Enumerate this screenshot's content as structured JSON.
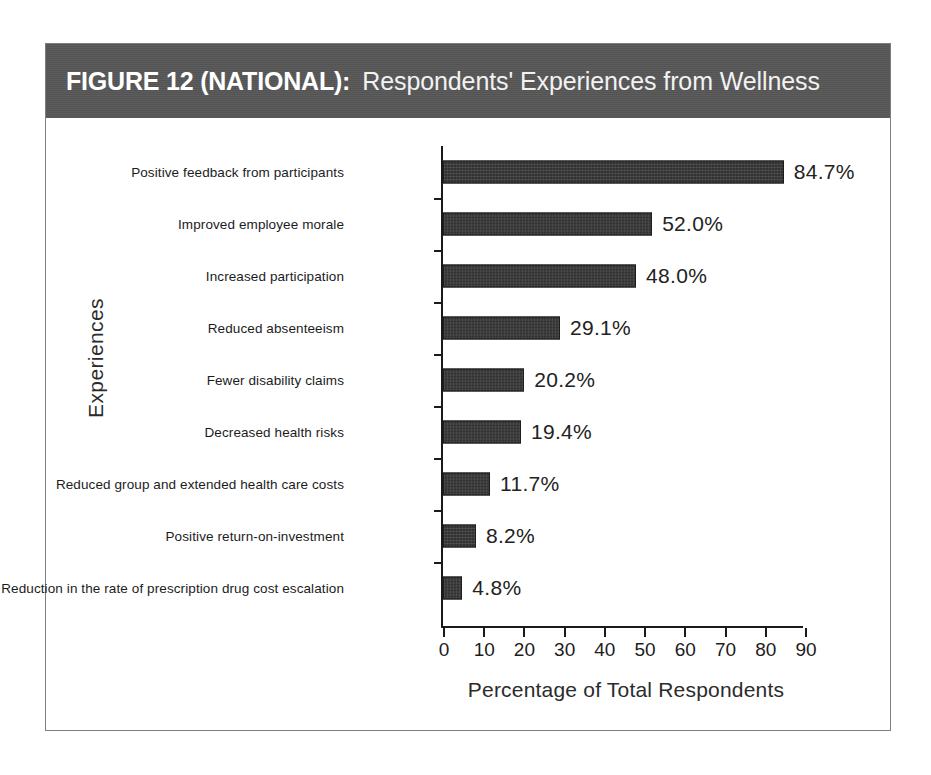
{
  "figure": {
    "label": "FIGURE 12 (NATIONAL):",
    "title": "Respondents' Experiences from Wellness",
    "band_color": "#565656",
    "frame_color": "#7e7e7e",
    "bar_color": "#323232",
    "background": "#ffffff"
  },
  "chart_data": {
    "type": "bar",
    "orientation": "horizontal",
    "title": "Respondents' Experiences from Wellness",
    "xlabel": "Percentage of Total Respondents",
    "ylabel": "Experiences",
    "xlim": [
      0,
      90
    ],
    "xticks": [
      0,
      10,
      20,
      30,
      40,
      50,
      60,
      70,
      80,
      90
    ],
    "grid": false,
    "legend": false,
    "categories": [
      "Positive feedback from participants",
      "Improved employee morale",
      "Increased participation",
      "Reduced absenteeism",
      "Fewer disability claims",
      "Decreased health risks",
      "Reduced group and extended health care costs",
      "Positive return-on-investment",
      "Reduction in the rate of prescription drug cost escalation"
    ],
    "values": [
      84.7,
      52.0,
      48.0,
      29.1,
      20.2,
      19.4,
      11.7,
      8.2,
      4.8
    ],
    "value_labels": [
      "84.7%",
      "52.0%",
      "48.0%",
      "29.1%",
      "20.2%",
      "19.4%",
      "11.7%",
      "8.2%",
      "4.8%"
    ]
  }
}
